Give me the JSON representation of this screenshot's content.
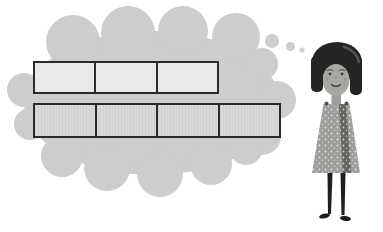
{
  "scene": {
    "background": "#ffffff",
    "description": "Girl imagining two partitioned unit strips inside a thought cloud"
  },
  "thought_cloud": {
    "fill": "#cdcdcb",
    "trail_bubbles": [
      {
        "cx": 272,
        "cy": 41,
        "r": 7
      },
      {
        "cx": 290.5,
        "cy": 46.5,
        "r": 4.5
      },
      {
        "cx": 302,
        "cy": 50,
        "r": 2.5
      }
    ]
  },
  "bars": [
    {
      "name": "top-strip",
      "cells": 3,
      "x": 33,
      "y": 61,
      "width": 186,
      "height": 33,
      "fill": "#e9e9e7",
      "border": "#2a2a2a",
      "textured": false
    },
    {
      "name": "bottom-strip",
      "cells": 4,
      "x": 33,
      "y": 103,
      "width": 248,
      "height": 35,
      "fill": "#d8d8d6",
      "border": "#2a2a2a",
      "textured": true
    }
  ],
  "character": {
    "hair": "#242422",
    "hair_highlight": "#5a5a5a",
    "skin": "#a9a7a3",
    "neck": "#9e9e9a",
    "dress": "#9d9d9b",
    "dress_band": "#636361",
    "dress_dot": "#f2f2f0",
    "strap_dot": "#55554f",
    "legs": "#1e1e1e",
    "features": "#3d3d3d",
    "brow": "#4a4a4a",
    "cheek": "#6b6b6b"
  }
}
